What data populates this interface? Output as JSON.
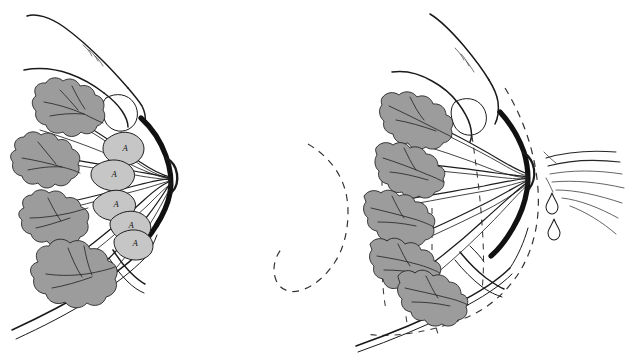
{
  "figure": {
    "background_color": "#ffffff",
    "width": 635,
    "height": 359,
    "style": "black-and-white anatomical line drawing with gray wash",
    "panel_count": 2
  },
  "palette": {
    "ink": "#1a1a1a",
    "areola_ink": "#111111",
    "alveoli_gray": "#9c9c9c",
    "ampulla_gray": "#c6c6c6",
    "ghost_outline": "#333333",
    "background": "#ffffff"
  },
  "panels": [
    {
      "id": "left",
      "name": "before-ejection",
      "caption": "",
      "description": "Breast held between finger and thumb before milk ejection; lactiferous sinuses distended with milk",
      "hand": {
        "present": true,
        "description": "index finger pressing from above with rounded fingernail, thumb below",
        "fingernail_shape": "rounded-rectangle"
      },
      "nipple": {
        "state": "closed",
        "milk_flow": false
      },
      "ghost_outline": false,
      "alveoli_clusters": [
        {
          "index": 1,
          "label": "",
          "shape": "rounded bumpy lobule",
          "state": "full"
        },
        {
          "index": 2,
          "label": "",
          "shape": "rounded bumpy lobule",
          "state": "full"
        },
        {
          "index": 3,
          "label": "",
          "shape": "rounded bumpy lobule",
          "state": "full"
        },
        {
          "index": 4,
          "label": "",
          "shape": "rounded bumpy lobule",
          "state": "full"
        }
      ],
      "ampullae": [
        {
          "index": 1,
          "label": "A"
        },
        {
          "index": 2,
          "label": "A"
        },
        {
          "index": 3,
          "label": "A"
        },
        {
          "index": 4,
          "label": "A"
        },
        {
          "index": 5,
          "label": "A"
        }
      ],
      "duct_count": 7,
      "spray_streams": 0,
      "droplets": 0
    },
    {
      "id": "right",
      "name": "after-ejection",
      "caption": "",
      "description": "Alveoli contracted and emptied; milk sprays from the nipple. Dashed line shows the previous, fuller outline",
      "hand": {
        "present": true,
        "description": "index finger pressing from above with rounded fingernail, thumb below",
        "fingernail_shape": "rounded-rectangle"
      },
      "nipple": {
        "state": "ejecting",
        "milk_flow": true
      },
      "ghost_outline": true,
      "alveoli_clusters": [
        {
          "index": 1,
          "label": "",
          "shape": "elongated contracted lobule",
          "state": "emptied"
        },
        {
          "index": 2,
          "label": "",
          "shape": "elongated contracted lobule",
          "state": "emptied"
        },
        {
          "index": 3,
          "label": "",
          "shape": "elongated contracted lobule",
          "state": "emptied"
        },
        {
          "index": 4,
          "label": "",
          "shape": "elongated contracted lobule",
          "state": "emptied"
        },
        {
          "index": 5,
          "label": "",
          "shape": "elongated contracted lobule",
          "state": "emptied"
        }
      ],
      "ampullae": [],
      "duct_count": 7,
      "spray_streams": 7,
      "droplets": 2
    }
  ],
  "legend": {
    "ampulla_key": "A",
    "ampulla_meaning": "ampulla (lactiferous sinus)"
  }
}
